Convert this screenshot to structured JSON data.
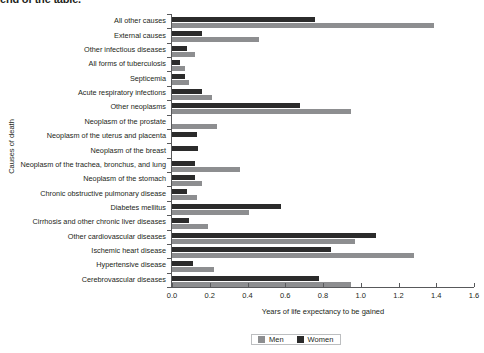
{
  "headline": "end of the table.",
  "chart_data": {
    "type": "bar",
    "orientation": "horizontal",
    "title": "",
    "xlabel": "Years of life expectancy to be gained",
    "ylabel": "Causes of death",
    "xlim": [
      0.0,
      1.6
    ],
    "xticks": [
      "0.0",
      "0.2",
      "0.4",
      "0.6",
      "0.8",
      "1.0",
      "1.2",
      "1.4",
      "1.6"
    ],
    "xtick_values": [
      0.0,
      0.2,
      0.4,
      0.6,
      0.8,
      1.0,
      1.2,
      1.4,
      1.6
    ],
    "grid": false,
    "legend_position": "bottom-center",
    "categories": [
      "All other causes",
      "External causes",
      "Other infectious diseases",
      "All forms of tuberculosis",
      "Septicemia",
      "Acute respiratory infections",
      "Other neoplasms",
      "Neoplasm of the prostate",
      "Neoplasm of the uterus and placenta",
      "Neoplasm of the breast",
      "Neoplasm of the trachea, bronchus, and lung",
      "Neoplasm of the stomach",
      "Chronic obstructive pulmonary disease",
      "Diabetes mellitus",
      "Cirrhosis and other chronic liver diseases",
      "Other cardiovascular diseases",
      "Ischemic heart disease",
      "Hypertensive disease",
      "Cerebrovascular diseases"
    ],
    "series": [
      {
        "name": "Men",
        "color": "#8d8e90",
        "values": [
          1.39,
          0.46,
          0.12,
          0.07,
          0.09,
          0.21,
          0.95,
          0.24,
          0.0,
          0.0,
          0.36,
          0.16,
          0.13,
          0.41,
          0.19,
          0.97,
          1.28,
          0.22,
          0.95
        ]
      },
      {
        "name": "Women",
        "color": "#2b2b2b",
        "values": [
          0.76,
          0.16,
          0.08,
          0.04,
          0.07,
          0.16,
          0.68,
          0.0,
          0.13,
          0.14,
          0.12,
          0.12,
          0.08,
          0.58,
          0.09,
          1.08,
          0.84,
          0.11,
          0.78
        ]
      }
    ]
  },
  "legend": {
    "items": [
      {
        "label": "Men",
        "color": "#8d8e90"
      },
      {
        "label": "Women",
        "color": "#2b2b2b"
      }
    ]
  }
}
